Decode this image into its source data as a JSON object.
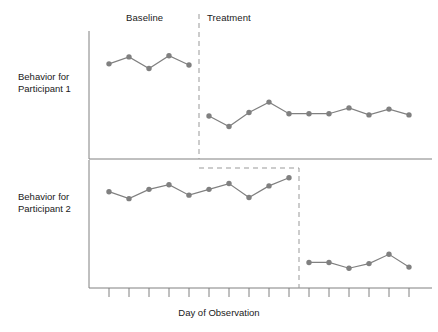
{
  "chart_data": {
    "type": "line",
    "title": "",
    "subtitle": "",
    "xlabel": "Day of Observation",
    "ylabel": "",
    "grid": false,
    "legend_position": "none",
    "design": "multiple-baseline across participants",
    "phase_labels": {
      "baseline": "Baseline",
      "treatment": "Treatment"
    },
    "axis": {
      "x_tick_count": 16,
      "x_tick_labels": [],
      "y_tick_labels": [],
      "x_range_days": [
        1,
        16
      ]
    },
    "panels": [
      {
        "id": "participant-1",
        "ylabel_line1": "Behavior for",
        "ylabel_line2": "Participant 1",
        "phase_change_day": 5.5,
        "series": [
          {
            "name": "Baseline",
            "phase": "baseline",
            "x": [
              1,
              2,
              3,
              4,
              5
            ],
            "y": [
              76,
              82,
              72,
              83,
              75
            ]
          },
          {
            "name": "Treatment",
            "phase": "treatment",
            "x": [
              6,
              7,
              8,
              9,
              10,
              11,
              12,
              13,
              14,
              15,
              16
            ],
            "y": [
              31,
              22,
              34,
              43,
              33,
              33,
              33,
              38,
              32,
              37,
              32
            ]
          }
        ]
      },
      {
        "id": "participant-2",
        "ylabel_line1": "Behavior for",
        "ylabel_line2": "Participant 2",
        "phase_change_day": 10.5,
        "series": [
          {
            "name": "Baseline",
            "phase": "baseline",
            "x": [
              1,
              2,
              3,
              4,
              5,
              6,
              7,
              8,
              9,
              10
            ],
            "y": [
              77,
              71,
              79,
              83,
              74,
              79,
              84,
              72,
              82,
              89
            ]
          },
          {
            "name": "Treatment",
            "phase": "treatment",
            "x": [
              11,
              12,
              13,
              14,
              15,
              16
            ],
            "y": [
              16,
              16,
              11,
              15,
              23,
              12
            ]
          }
        ]
      }
    ],
    "colors": {
      "marker": "#808080",
      "line": "#808080",
      "axis": "#808080",
      "phase_line": "#999999",
      "text": "#1a1a1a"
    }
  }
}
